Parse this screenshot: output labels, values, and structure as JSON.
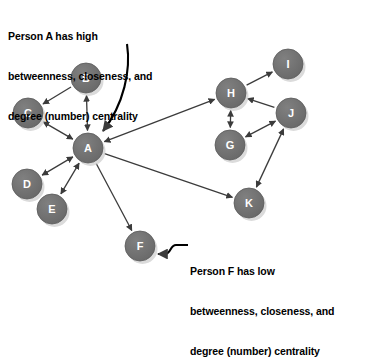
{
  "figure": {
    "background": "#ffffff",
    "node_fill": "#6e6e6e",
    "node_stroke": "#5a5a5a",
    "node_label_color": "#ffffff",
    "edge_color": "#3b3b3b",
    "shadow_color": "#cfcfcf",
    "node_radius": 15
  },
  "annotations": {
    "person_a": {
      "line1": "Person A has high",
      "line2": "betweenness, closeness, and",
      "line3": "degree (number) centrality",
      "points_to": "A"
    },
    "person_f": {
      "line1": "Person F has low",
      "line2": "betweenness, closeness, and",
      "line3": "degree (number) centrality",
      "points_to": "F"
    }
  },
  "chart_data": {
    "type": "graph",
    "directed": true,
    "nodes": [
      {
        "id": "A",
        "label": "A",
        "x": 88,
        "y": 148
      },
      {
        "id": "B",
        "label": "B",
        "x": 86,
        "y": 78
      },
      {
        "id": "C",
        "label": "C",
        "x": 28,
        "y": 113
      },
      {
        "id": "D",
        "label": "D",
        "x": 27,
        "y": 184
      },
      {
        "id": "E",
        "label": "E",
        "x": 52,
        "y": 209
      },
      {
        "id": "F",
        "label": "F",
        "x": 140,
        "y": 246
      },
      {
        "id": "G",
        "label": "G",
        "x": 230,
        "y": 145
      },
      {
        "id": "H",
        "label": "H",
        "x": 231,
        "y": 93
      },
      {
        "id": "I",
        "label": "I",
        "x": 288,
        "y": 64
      },
      {
        "id": "J",
        "label": "J",
        "x": 291,
        "y": 113
      },
      {
        "id": "K",
        "label": "K",
        "x": 249,
        "y": 203
      }
    ],
    "edges": [
      {
        "from": "B",
        "to": "C",
        "arrows": "to"
      },
      {
        "from": "B",
        "to": "A",
        "arrows": "both"
      },
      {
        "from": "C",
        "to": "A",
        "arrows": "both"
      },
      {
        "from": "D",
        "to": "A",
        "arrows": "both"
      },
      {
        "from": "E",
        "to": "A",
        "arrows": "both"
      },
      {
        "from": "A",
        "to": "F",
        "arrows": "to"
      },
      {
        "from": "A",
        "to": "H",
        "arrows": "both"
      },
      {
        "from": "A",
        "to": "K",
        "arrows": "to"
      },
      {
        "from": "H",
        "to": "I",
        "arrows": "to"
      },
      {
        "from": "H",
        "to": "G",
        "arrows": "both"
      },
      {
        "from": "J",
        "to": "H",
        "arrows": "to"
      },
      {
        "from": "J",
        "to": "G",
        "arrows": "both"
      },
      {
        "from": "J",
        "to": "K",
        "arrows": "both"
      }
    ],
    "node_degrees": {
      "A": 7,
      "B": 2,
      "C": 2,
      "D": 1,
      "E": 1,
      "F": 1,
      "G": 2,
      "H": 4,
      "I": 1,
      "J": 3,
      "K": 2
    }
  }
}
